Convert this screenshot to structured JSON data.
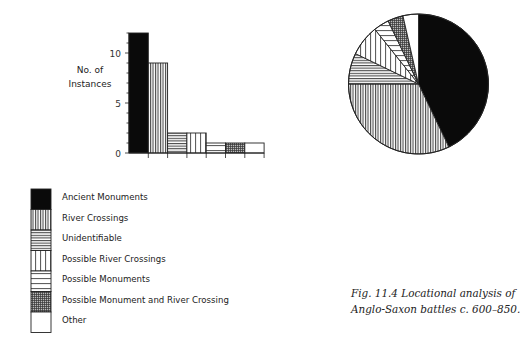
{
  "chart_data": [
    {
      "type": "bar",
      "title": "",
      "xlabel": "",
      "ylabel": "No. of Instances",
      "ylim": [
        0,
        12
      ],
      "yticks": [
        0,
        5,
        10
      ],
      "grid": false,
      "categories": [
        "Ancient Monuments",
        "River Crossings",
        "Unidentifiable",
        "Possible River Crossings",
        "Possible Monuments",
        "Possible Monument and River Crossing",
        "Other"
      ],
      "values": [
        12,
        9,
        2,
        2,
        1,
        1,
        1
      ],
      "patterns": [
        "solid-black",
        "dense-vertical",
        "dense-horizontal",
        "wide-vertical",
        "wide-horizontal",
        "cross-hatch",
        "white"
      ]
    },
    {
      "type": "pie",
      "title": "",
      "categories": [
        "Ancient Monuments",
        "River Crossings",
        "Unidentifiable",
        "Possible River Crossings",
        "Possible Monuments",
        "Possible Monument and River Crossing",
        "Other"
      ],
      "values": [
        12,
        9,
        2,
        2,
        1,
        1,
        1
      ],
      "start_angle": "12 o'clock, clockwise",
      "patterns": [
        "solid-black",
        "dense-vertical",
        "dense-horizontal",
        "wide-vertical",
        "wide-horizontal",
        "cross-hatch",
        "white"
      ]
    }
  ],
  "axis": {
    "ylabel_line1": "No. of",
    "ylabel_line2": "Instances"
  },
  "legend": [
    {
      "label": "Ancient Monuments",
      "pattern": "solid-black"
    },
    {
      "label": "River Crossings",
      "pattern": "dense-vertical"
    },
    {
      "label": "Unidentifiable",
      "pattern": "dense-horizontal"
    },
    {
      "label": "Possible River Crossings",
      "pattern": "wide-vertical"
    },
    {
      "label": "Possible Monuments",
      "pattern": "wide-horizontal"
    },
    {
      "label": "Possible Monument and River Crossing",
      "pattern": "cross-hatch"
    },
    {
      "label": "Other",
      "pattern": "white"
    }
  ],
  "caption": {
    "line1": "Fig. 11.4  Locational analysis of",
    "line2": "Anglo-Saxon battles c. 600–850."
  }
}
